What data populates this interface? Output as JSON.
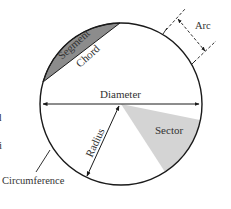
{
  "diagram": {
    "labels": {
      "segment": "Segment",
      "chord": "Chord",
      "arc": "Arc",
      "diameter": "Diameter",
      "radius": "Radius",
      "sector": "Sector",
      "circumference": "Circumference"
    },
    "edge_fragments": [
      "d",
      "i"
    ],
    "colors": {
      "stroke": "#1a1a1a",
      "segment_fill": "#8c8c8c",
      "sector_fill": "#d4d4d4",
      "text": "#333333",
      "background": "#ffffff"
    }
  }
}
